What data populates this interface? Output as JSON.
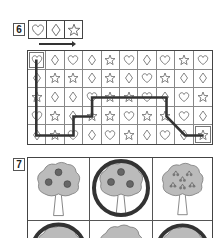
{
  "exercise6": {
    "number": "6",
    "legend": [
      "heart",
      "diamond",
      "star"
    ],
    "arrow": "right",
    "grid": {
      "rows": 5,
      "cols": 10,
      "cells": [
        [
          "heart",
          "diamond",
          "heart",
          "diamond",
          "star",
          "heart",
          "diamond",
          "heart",
          "star",
          "heart"
        ],
        [
          "diamond",
          "star",
          "star",
          "diamond",
          "star",
          "diamond",
          "heart",
          "star",
          "diamond",
          "diamond"
        ],
        [
          "star",
          "diamond",
          "diamond",
          "heart",
          "star",
          "star",
          "heart",
          "diamond",
          "heart",
          "star"
        ],
        [
          "heart",
          "star",
          "diamond",
          "star",
          "star",
          "heart",
          "star",
          "star",
          "heart",
          "diamond"
        ],
        [
          "diamond",
          "star",
          "heart",
          "diamond",
          "heart",
          "star",
          "diamond",
          "heart",
          "diamond",
          "star"
        ]
      ],
      "start": {
        "row": 0,
        "col": 0
      },
      "end": {
        "row": 4,
        "col": 9
      },
      "path": [
        [
          0,
          0
        ],
        [
          4,
          0
        ],
        [
          4,
          2
        ],
        [
          3,
          2
        ],
        [
          3,
          3
        ],
        [
          2,
          3
        ],
        [
          2,
          7
        ],
        [
          3,
          7
        ],
        [
          4,
          8
        ],
        [
          4,
          9
        ]
      ]
    }
  },
  "exercise7": {
    "number": "7",
    "trees": [
      {
        "fruit": "apple",
        "count": 3,
        "circled": false
      },
      {
        "fruit": "apple",
        "count": 3,
        "circled": true
      },
      {
        "fruit": "cherry",
        "count": 6,
        "circled": false
      },
      {
        "fruit": "unknown",
        "count": 0,
        "circled": true
      },
      {
        "fruit": "unknown",
        "count": 1,
        "circled": false
      },
      {
        "fruit": "unknown",
        "count": 0,
        "circled": true
      }
    ]
  }
}
